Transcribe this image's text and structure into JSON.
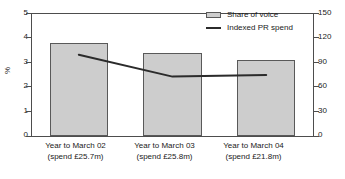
{
  "chart_data": {
    "type": "bar",
    "title": "",
    "categories": [
      "Year to March 02",
      "Year to March 03",
      "Year to March 04"
    ],
    "category_sublabels": [
      "(spend £25.7m)",
      "(spend £25.8m)",
      "(spend £21.8m)"
    ],
    "series": [
      {
        "name": "Share of voice",
        "type": "bar",
        "axis": "left",
        "values": [
          3.8,
          3.4,
          3.1
        ],
        "color": "#cdcdcd",
        "edge_color": "#595959"
      },
      {
        "name": "Indexed PR spend",
        "type": "line",
        "axis": "right",
        "values": [
          100,
          73,
          75
        ],
        "color": "#2b2b2b"
      }
    ],
    "xlabel": "",
    "ylabel": "%",
    "ylabel_right": "",
    "ylim": [
      0,
      5
    ],
    "ylim_right": [
      0,
      150
    ],
    "yticks": [
      0,
      1,
      2,
      3,
      4,
      5
    ],
    "yticks_right": [
      0,
      30,
      60,
      90,
      120,
      150
    ],
    "grid": false,
    "legend_position": "top-right"
  },
  "legend": {
    "entries": [
      {
        "label": "Share of voice",
        "marker": "bar-swatch"
      },
      {
        "label": "Indexed PR spend",
        "marker": "line-swatch"
      }
    ]
  },
  "axes": {
    "left_ticks": [
      "5",
      "4",
      "3",
      "2",
      "1",
      "0"
    ],
    "right_ticks": [
      "150",
      "120",
      "90",
      "60",
      "30",
      "0"
    ],
    "y_axis_label": "%"
  }
}
